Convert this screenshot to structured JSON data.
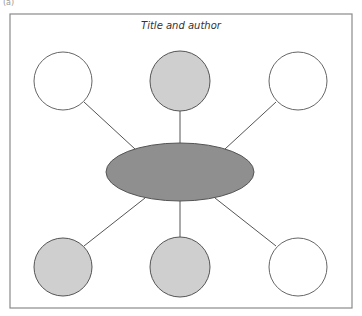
{
  "figure_label": "(a)",
  "title": "Title and author",
  "colors": {
    "frame": "#8a8a8a",
    "line": "#555555",
    "center_fill": "#8f8f8f",
    "shaded_fill": "#cfcfcf",
    "empty_fill": "#ffffff"
  },
  "center": {
    "shape": "ellipse",
    "cx": 180,
    "cy": 172,
    "rx": 74,
    "ry": 29,
    "fill": "dark-gray"
  },
  "nodes": [
    {
      "id": "top-left",
      "cx": 63,
      "cy": 81,
      "r": 29,
      "fill": "white"
    },
    {
      "id": "top-center",
      "cx": 180,
      "cy": 81,
      "r": 30,
      "fill": "gray"
    },
    {
      "id": "top-right",
      "cx": 298,
      "cy": 81,
      "r": 29,
      "fill": "white"
    },
    {
      "id": "bottom-left",
      "cx": 63,
      "cy": 267,
      "r": 29,
      "fill": "gray"
    },
    {
      "id": "bottom-center",
      "cx": 180,
      "cy": 267,
      "r": 30,
      "fill": "gray"
    },
    {
      "id": "bottom-right",
      "cx": 298,
      "cy": 267,
      "r": 29,
      "fill": "white"
    }
  ]
}
